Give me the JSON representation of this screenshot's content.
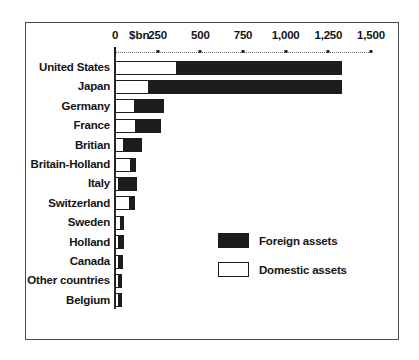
{
  "chart_data": {
    "type": "bar",
    "orientation": "horizontal",
    "stacked": true,
    "title": "",
    "subtitle": "",
    "xlabel": "$bn",
    "ylabel": "",
    "xlim": [
      0,
      1500
    ],
    "xticks": [
      0,
      250,
      500,
      750,
      1000,
      1250,
      1500
    ],
    "xtick_labels": [
      "0",
      "250",
      "500",
      "750",
      "1,000",
      "1,250",
      "1,500"
    ],
    "unit_label": "$bn",
    "grid": false,
    "axis_style": "dotted-tick-line",
    "legend_position": "inside-center-right",
    "categories": [
      "United States",
      "Japan",
      "Germany",
      "France",
      "Britian",
      "Britain-Holland",
      "Italy",
      "Switzerland",
      "Sweden",
      "Holland",
      "Canada",
      "Other countries",
      "Belgium"
    ],
    "series": [
      {
        "name": "Domestic assets",
        "color": "#ffffff",
        "values": [
          365,
          200,
          120,
          125,
          55,
          95,
          20,
          90,
          35,
          10,
          8,
          8,
          6
        ]
      },
      {
        "name": "Foreign assets",
        "color": "#1c1c1c",
        "values": [
          975,
          1140,
          175,
          155,
          110,
          35,
          115,
          35,
          10,
          35,
          32,
          22,
          26
        ]
      }
    ],
    "totals": [
      1340,
      1340,
      295,
      280,
      165,
      130,
      135,
      125,
      45,
      45,
      40,
      30,
      32
    ]
  },
  "legend": {
    "items": [
      {
        "label": "Foreign assets",
        "swatch": "filled"
      },
      {
        "label": "Domestic assets",
        "swatch": "hollow"
      }
    ]
  },
  "colors": {
    "foreign": "#1c1c1c",
    "domestic": "#ffffff",
    "frame": "#4a4a4a",
    "text": "#141414",
    "axis": "#2b2b2b"
  }
}
